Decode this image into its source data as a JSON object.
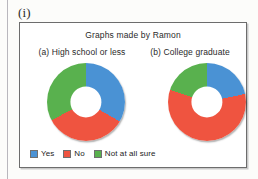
{
  "item_label": "(i)",
  "figure": {
    "title": "Graphs made by Ramon",
    "panels": [
      {
        "caption": "(a) High school or less"
      },
      {
        "caption": "(b) College graduate"
      }
    ],
    "legend": [
      {
        "label": "Yes",
        "color": "#4a92d4",
        "name": "legend-swatch-yes"
      },
      {
        "label": "No",
        "color": "#ef5440",
        "name": "legend-swatch-no"
      },
      {
        "label": "Not at all sure",
        "color": "#59b14e",
        "name": "legend-swatch-not-at-all-sure"
      }
    ]
  },
  "colors": {
    "yes": "#4a92d4",
    "no": "#ef5440",
    "not_at_all_sure": "#59b14e",
    "frame": "#6d6d6d",
    "hole": "#ffffff"
  },
  "chart_data": [
    {
      "type": "pie",
      "variant": "donut",
      "title": "(a) High school or less",
      "figure_title": "Graphs made by Ramon",
      "categories": [
        "Yes",
        "No",
        "Not at all sure"
      ],
      "values": [
        33,
        34,
        33
      ],
      "units": "percent",
      "start_angle_deg": 0,
      "direction": "clockwise",
      "segment_angles_deg": [
        120,
        122,
        118
      ],
      "colors": [
        "#4a92d4",
        "#ef5440",
        "#59b14e"
      ],
      "legend_position": "bottom",
      "grid": false,
      "xlabel": "",
      "ylabel": ""
    },
    {
      "type": "pie",
      "variant": "donut",
      "title": "(b) College graduate",
      "figure_title": "Graphs made by Ramon",
      "categories": [
        "Yes",
        "No",
        "Not at all sure"
      ],
      "values": [
        22,
        58,
        20
      ],
      "units": "percent",
      "start_angle_deg": 0,
      "direction": "clockwise",
      "segment_angles_deg": [
        78,
        210,
        72
      ],
      "colors": [
        "#4a92d4",
        "#ef5440",
        "#59b14e"
      ],
      "legend_position": "bottom",
      "grid": false,
      "xlabel": "",
      "ylabel": ""
    }
  ]
}
